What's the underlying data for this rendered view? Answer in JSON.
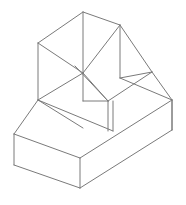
{
  "figure": {
    "type": "line-drawing",
    "width": 186,
    "height": 205,
    "background_color": "#ffffff",
    "line_color": "#7a7a7a",
    "line_width": 1
  },
  "chart_data": {
    "type": "line",
    "xlabel": "",
    "ylabel": "",
    "xlim": [
      0,
      186
    ],
    "ylim": [
      0,
      205
    ],
    "grid": false,
    "legend": "none",
    "vertices": {
      "apex_top_back": [
        83,
        12
      ],
      "top_left_back": [
        38,
        43
      ],
      "top_right_back": [
        120,
        25
      ],
      "top_center_front": [
        83,
        73
      ],
      "top_left_front_upper": [
        38,
        43
      ],
      "mid_left_low": [
        38,
        100
      ],
      "mid_center_junction": [
        83,
        73
      ],
      "slant_foot_right": [
        152,
        72
      ],
      "step_notch": [
        108,
        101
      ],
      "base_left_top": [
        14,
        134
      ],
      "base_left_bottom": [
        14,
        165
      ],
      "base_bottom_front": [
        80,
        188
      ],
      "base_right_top": [
        172,
        100
      ],
      "base_right_bottom": [
        172,
        130
      ],
      "base_mid_right": [
        113,
        131
      ]
    },
    "segments": [
      {
        "name": "top-back-left-ridge",
        "x1": 83,
        "y1": 12,
        "x2": 38,
        "y2": 43
      },
      {
        "name": "top-back-right-ridge",
        "x1": 83,
        "y1": 12,
        "x2": 120,
        "y2": 25
      },
      {
        "name": "top-vertical-center",
        "x1": 83,
        "y1": 12,
        "x2": 83,
        "y2": 73
      },
      {
        "name": "top-front-left-ridge",
        "x1": 38,
        "y1": 43,
        "x2": 83,
        "y2": 73
      },
      {
        "name": "top-front-right-ridge",
        "x1": 120,
        "y1": 25,
        "x2": 83,
        "y2": 73
      },
      {
        "name": "upper-left-vertical",
        "x1": 38,
        "y1": 43,
        "x2": 38,
        "y2": 100
      },
      {
        "name": "upper-right-vertical",
        "x1": 120,
        "y1": 25,
        "x2": 120,
        "y2": 78
      },
      {
        "name": "center-vertical-drop",
        "x1": 83,
        "y1": 73,
        "x2": 83,
        "y2": 101
      },
      {
        "name": "slant-chamfer-edge",
        "x1": 120,
        "y1": 25,
        "x2": 152,
        "y2": 72
      },
      {
        "name": "slant-lower-edge",
        "x1": 120,
        "y1": 78,
        "x2": 152,
        "y2": 72
      },
      {
        "name": "upper-left-face-bottom",
        "x1": 38,
        "y1": 100,
        "x2": 83,
        "y2": 73
      },
      {
        "name": "mid-shelf-left",
        "x1": 38,
        "y1": 100,
        "x2": 83,
        "y2": 128
      },
      {
        "name": "mid-shelf-to-notch",
        "x1": 83,
        "y1": 101,
        "x2": 108,
        "y2": 101
      },
      {
        "name": "notch-diagonal-a",
        "x1": 83,
        "y1": 73,
        "x2": 108,
        "y2": 101
      },
      {
        "name": "notch-diagonal-b",
        "x1": 75,
        "y1": 66,
        "x2": 108,
        "y2": 101
      },
      {
        "name": "shelf-right-ridge",
        "x1": 108,
        "y1": 101,
        "x2": 152,
        "y2": 72
      },
      {
        "name": "shelf-right-top",
        "x1": 120,
        "y1": 78,
        "x2": 172,
        "y2": 100
      },
      {
        "name": "shelf-right-edge",
        "x1": 152,
        "y1": 72,
        "x2": 172,
        "y2": 100
      },
      {
        "name": "right-outer-vertical",
        "x1": 172,
        "y1": 100,
        "x2": 172,
        "y2": 130
      },
      {
        "name": "notch-vertical",
        "x1": 108,
        "y1": 101,
        "x2": 108,
        "y2": 131
      },
      {
        "name": "notch-vertical-inner",
        "x1": 113,
        "y1": 101,
        "x2": 113,
        "y2": 131
      },
      {
        "name": "base-top-back-left",
        "x1": 38,
        "y1": 100,
        "x2": 14,
        "y2": 134
      },
      {
        "name": "base-top-left-front",
        "x1": 14,
        "y1": 134,
        "x2": 80,
        "y2": 158
      },
      {
        "name": "base-top-front-right",
        "x1": 80,
        "y1": 158,
        "x2": 172,
        "y2": 100
      },
      {
        "name": "base-top-mid-diagonal",
        "x1": 38,
        "y1": 100,
        "x2": 113,
        "y2": 131
      },
      {
        "name": "base-left-vertical",
        "x1": 14,
        "y1": 134,
        "x2": 14,
        "y2": 165
      },
      {
        "name": "base-front-vertical",
        "x1": 80,
        "y1": 158,
        "x2": 80,
        "y2": 188
      },
      {
        "name": "base-bottom-left",
        "x1": 14,
        "y1": 165,
        "x2": 80,
        "y2": 188
      },
      {
        "name": "base-bottom-right",
        "x1": 80,
        "y1": 188,
        "x2": 172,
        "y2": 130
      },
      {
        "name": "base-inner-right-vertical",
        "x1": 172,
        "y1": 100,
        "x2": 172,
        "y2": 130
      }
    ]
  }
}
